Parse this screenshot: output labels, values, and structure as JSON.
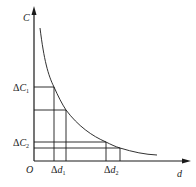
{
  "diagram": {
    "type": "capacitance-vs-distance curve",
    "axes": {
      "y_label": "C",
      "x_label": "d",
      "origin_label": "O"
    },
    "annotations": {
      "delta_c1": {
        "prefix": "Δ",
        "var": "C",
        "sub": "1"
      },
      "delta_c2": {
        "prefix": "Δ",
        "var": "C",
        "sub": "2"
      },
      "delta_d1": {
        "prefix": "Δ",
        "var": "d",
        "sub": "1"
      },
      "delta_d2": {
        "prefix": "Δ",
        "var": "d",
        "sub": "2"
      }
    },
    "colors": {
      "line": "#1a1a1a",
      "background": "#ffffff"
    }
  }
}
